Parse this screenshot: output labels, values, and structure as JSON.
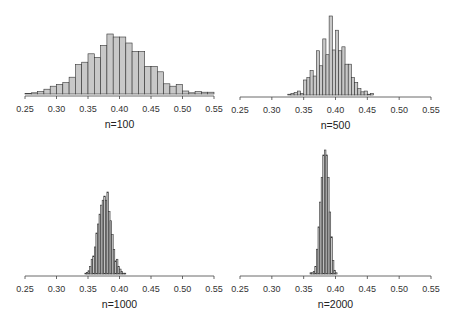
{
  "chart_data": [
    {
      "type": "bar",
      "title": "",
      "xlabel": "n=100",
      "ylabel": "",
      "xlim": [
        0.25,
        0.55
      ],
      "xticks": [
        "0.25",
        "0.30",
        "0.35",
        "0.40",
        "0.45",
        "0.50",
        "0.55"
      ],
      "bin_width": 0.01,
      "bin_start": 0.25,
      "grid": false,
      "values": [
        1,
        2,
        4,
        8,
        13,
        16,
        19,
        28,
        49,
        53,
        67,
        61,
        81,
        100,
        95,
        95,
        85,
        71,
        71,
        46,
        46,
        37,
        17,
        13,
        16,
        5,
        2,
        4,
        3,
        3
      ],
      "layout": {
        "x0": 25,
        "x1": 214,
        "axis_y": 94,
        "max_h": 60,
        "label_y": 108,
        "xlabel_y": 124
      }
    },
    {
      "type": "bar",
      "title": "",
      "xlabel": "n=500",
      "ylabel": "",
      "xlim": [
        0.25,
        0.55
      ],
      "xticks": [
        "0.25",
        "0.30",
        "0.35",
        "0.40",
        "0.45",
        "0.50",
        "0.55"
      ],
      "bin_width": 0.005,
      "bin_start": 0.325,
      "grid": false,
      "values": [
        1,
        2,
        3,
        5,
        2,
        19,
        22,
        31,
        24,
        56,
        37,
        71,
        51,
        100,
        57,
        82,
        56,
        61,
        39,
        39,
        22,
        16,
        8,
        4,
        5,
        1,
        2
      ],
      "layout": {
        "x0": 240,
        "x1": 431,
        "axis_y": 95,
        "max_h": 79,
        "label_y": 109,
        "xlabel_y": 125
      }
    },
    {
      "type": "bar",
      "title": "",
      "xlabel": "n=1000",
      "ylabel": "",
      "xlim": [
        0.25,
        0.55
      ],
      "xticks": [
        "0.25",
        "0.30",
        "0.35",
        "0.40",
        "0.45",
        "0.50",
        "0.55"
      ],
      "bin_width": 0.0025,
      "bin_start": 0.345,
      "grid": false,
      "values": [
        1,
        2,
        4,
        9,
        18,
        22,
        33,
        50,
        61,
        73,
        84,
        90,
        95,
        90,
        100,
        76,
        65,
        48,
        30,
        16,
        18,
        9,
        6,
        3,
        1,
        1
      ],
      "layout": {
        "x0": 25,
        "x1": 214,
        "axis_y": 274,
        "max_h": 82,
        "label_y": 288,
        "xlabel_y": 304
      }
    },
    {
      "type": "bar",
      "title": "",
      "xlabel": "n=2000",
      "ylabel": "",
      "xlim": [
        0.25,
        0.55
      ],
      "xticks": [
        "0.25",
        "0.30",
        "0.35",
        "0.40",
        "0.45",
        "0.50",
        "0.55"
      ],
      "bin_width": 0.0025,
      "bin_start": 0.36,
      "grid": false,
      "values": [
        1,
        1,
        2,
        6,
        20,
        38,
        58,
        78,
        96,
        100,
        96,
        78,
        50,
        30,
        11,
        3,
        1
      ],
      "layout": {
        "x0": 240,
        "x1": 431,
        "axis_y": 274,
        "max_h": 124,
        "label_y": 288,
        "xlabel_y": 304
      }
    }
  ]
}
